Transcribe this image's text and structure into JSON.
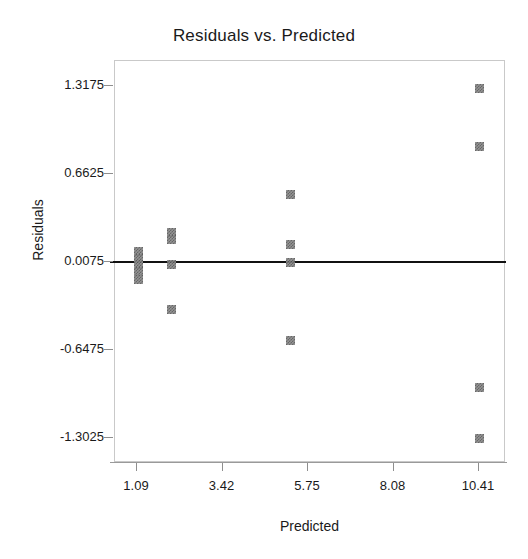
{
  "chart_data": {
    "type": "scatter",
    "title": "Residuals vs. Predicted",
    "xlabel": "Predicted",
    "ylabel": "Residuals",
    "xticks": [
      "1.09",
      "3.42",
      "5.75",
      "8.08",
      "10.41"
    ],
    "xtick_values": [
      1.09,
      3.42,
      5.75,
      8.08,
      10.41
    ],
    "yticks": [
      "1.3175",
      "0.6625",
      "0.0075",
      "-0.6475",
      "-1.3025"
    ],
    "ytick_values": [
      1.3175,
      0.6625,
      0.0075,
      -0.6475,
      -1.3025
    ],
    "xlim": [
      0.47,
      11.03
    ],
    "ylim": [
      -1.62,
      1.63
    ],
    "grid": false,
    "legend": null,
    "reference_line": {
      "name": "zero-residual-line",
      "y": 0.0075,
      "orientation": "horizontal",
      "color": "#111111"
    },
    "marker_style": "dithered-gray-square",
    "points": [
      {
        "x": 1.12,
        "y": 0.09
      },
      {
        "x": 1.12,
        "y": 0.04
      },
      {
        "x": 1.12,
        "y": -0.01
      },
      {
        "x": 1.12,
        "y": -0.06
      },
      {
        "x": 1.12,
        "y": -0.12
      },
      {
        "x": 2.02,
        "y": 0.23
      },
      {
        "x": 2.02,
        "y": 0.18
      },
      {
        "x": 2.02,
        "y": -0.01
      },
      {
        "x": 2.02,
        "y": -0.34
      },
      {
        "x": 5.27,
        "y": 0.51
      },
      {
        "x": 5.27,
        "y": 0.14
      },
      {
        "x": 5.27,
        "y": 0.01
      },
      {
        "x": 5.27,
        "y": -0.57
      },
      {
        "x": 10.41,
        "y": 1.3
      },
      {
        "x": 10.41,
        "y": 0.87
      },
      {
        "x": 10.41,
        "y": -0.92
      },
      {
        "x": 10.41,
        "y": -1.3
      }
    ]
  },
  "colors": {
    "marker": "#8c8c8c",
    "marker_dither": "#5a5a5a",
    "reference_line": "#111111",
    "frame": "#c9c9c9",
    "axis": "#9a9a9a",
    "text": "#1a1a1a",
    "background": "#ffffff"
  }
}
